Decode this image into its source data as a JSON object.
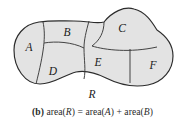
{
  "figure": {
    "caption": {
      "tag": "(b)",
      "text": "area(R) = area(A) + area(B)",
      "parts": {
        "area1": "area(",
        "var1": "R",
        "close1": ") = area(",
        "var2": "A",
        "close2": ") + area(",
        "var3": "B",
        "close3": ")"
      }
    },
    "whole_region_label": "R",
    "subregions": [
      {
        "id": "A",
        "label": "A",
        "x": 29,
        "y": 48
      },
      {
        "id": "B",
        "label": "B",
        "x": 67,
        "y": 33
      },
      {
        "id": "C",
        "label": "C",
        "x": 122,
        "y": 29
      },
      {
        "id": "D",
        "label": "D",
        "x": 53,
        "y": 72
      },
      {
        "id": "E",
        "label": "E",
        "x": 98,
        "y": 63
      },
      {
        "id": "F",
        "label": "F",
        "x": 153,
        "y": 66
      }
    ],
    "colors": {
      "background": "#ffffff",
      "region_fill": "#e3e3e3",
      "outline": "#2b2b2b",
      "divider": "#3a3a3a",
      "label_text": "#1a1a1a",
      "caption_text": "#2a2a2a"
    },
    "outline_path": "M 14 50 C 14 36, 24 24, 39 22 C 52 20, 62 21, 74 21 C 88 21, 96 24, 104 22 C 112 12, 124 6, 134 9 C 146 12, 152 22, 157 30 C 166 36, 173 44, 173 56 C 173 70, 163 82, 148 85 C 132 88, 118 84, 106 78 C 96 73, 86 70, 76 72 C 64 75, 54 84, 40 84 C 25 84, 14 68, 14 50 Z",
    "divider_paths": [
      "M 43 22 C 46 36, 44 52, 36 84",
      "M 89 21 C 86 32, 84 40, 84 48 C 84 60, 86 70, 84 79",
      "M 44 43 C 56 41, 72 42, 84 48",
      "M 104 22 C 104 32, 100 40, 92 46 C 105 50, 130 53, 157 47",
      "M 130 49 C 130 60, 130 72, 130 83"
    ]
  }
}
